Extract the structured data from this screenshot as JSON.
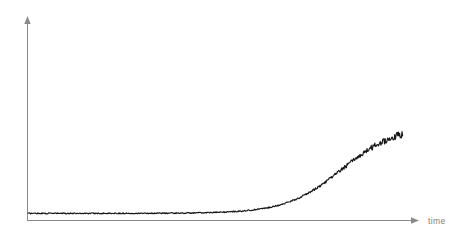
{
  "chart_data": {
    "type": "line",
    "title": "",
    "subtitle": "",
    "xlabel": "time",
    "ylabel": "",
    "grid": false,
    "legend": null,
    "legend_position": "none",
    "annotations": [],
    "xticks": [],
    "yticks": [],
    "xticklabels": [],
    "yticklabels": [],
    "xlim": [
      0,
      1
    ],
    "ylim": [
      0,
      1
    ],
    "axis_style": "arrow",
    "series": [
      {
        "name": "growth",
        "color": "#161616",
        "noise_amplitude_lag": 0.006,
        "noise_amplitude_plateau": 0.042,
        "model": "logistic",
        "logistic_L": 0.955,
        "logistic_k": 14.6,
        "logistic_x0": 0.775,
        "baseline": 0.028,
        "x_start": 0.0,
        "x_end": 0.925,
        "x": [
          0.0,
          0.05,
          0.1,
          0.15,
          0.2,
          0.25,
          0.3,
          0.35,
          0.4,
          0.45,
          0.5,
          0.55,
          0.6,
          0.65,
          0.7,
          0.75,
          0.8,
          0.85,
          0.9,
          0.925
        ],
        "values": [
          0.026,
          0.031,
          0.037,
          0.044,
          0.053,
          0.064,
          0.079,
          0.098,
          0.124,
          0.159,
          0.208,
          0.276,
          0.369,
          0.492,
          0.639,
          0.783,
          0.89,
          0.943,
          0.955,
          0.956
        ]
      }
    ]
  },
  "axes": {
    "x_axis_label": "time",
    "y_axis_label": "",
    "x_axis_color": "#8a8a8a",
    "y_axis_color": "#8a8a8a"
  },
  "canvas": {
    "width": 468,
    "height": 238,
    "background": "#ffffff"
  }
}
